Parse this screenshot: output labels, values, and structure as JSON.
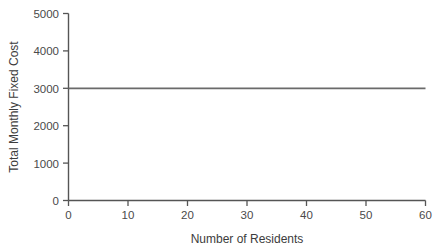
{
  "chart_data": {
    "type": "line",
    "title": "",
    "subtitle": "",
    "xlabel": "Number of Residents",
    "ylabel": "Total Monthly Fixed Cost",
    "xlim": [
      0,
      60
    ],
    "ylim": [
      0,
      5000
    ],
    "xticks": [
      0,
      10,
      20,
      30,
      40,
      50,
      60
    ],
    "yticks": [
      0,
      1000,
      2000,
      3000,
      4000,
      5000
    ],
    "xtick_labels": [
      "0",
      "10",
      "20",
      "30",
      "40",
      "50",
      "60"
    ],
    "ytick_labels": [
      "0",
      "1000",
      "2000",
      "3000",
      "4000",
      "5000"
    ],
    "grid": false,
    "legend": null,
    "annotations": [],
    "series": [
      {
        "name": "Total Monthly Fixed Cost",
        "color": "#6a6a6a",
        "x": [
          0,
          10,
          20,
          30,
          40,
          50,
          60
        ],
        "values": [
          3000,
          3000,
          3000,
          3000,
          3000,
          3000,
          3000
        ]
      }
    ]
  },
  "style": {
    "axis_color": "#555555",
    "line_color": "#6a6a6a",
    "text_color": "#3c3c3c",
    "background": "#ffffff"
  }
}
